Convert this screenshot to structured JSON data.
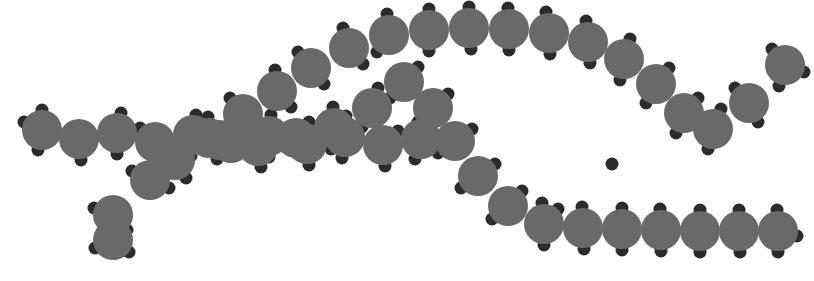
{
  "canvas": {
    "width": 814,
    "height": 281,
    "background_color": "#ffffff",
    "title": "space-filling-molecular-model"
  },
  "style": {
    "carbon_color": "#6b6b6b",
    "hydrogen_color": "#2b2b2b",
    "carbon_radius": 20,
    "hydrogen_radius": 6.5,
    "outline_color": "#5f5f5f",
    "noise_opacity": 0.07
  },
  "legend": {
    "carbon_label": "carbon (large grey sphere)",
    "hydrogen_label": "hydrogen (small dark sphere)"
  },
  "chains": [
    {
      "name": "lower-left-main-chain",
      "description": "zig-zag alkyl chain entering from the left edge and rising to the right",
      "carbons": [
        {
          "x": 42,
          "y": 130,
          "hydrogens": [
            [
              -18,
              -8
            ],
            [
              0,
              -20
            ],
            [
              -4,
              20
            ]
          ]
        },
        {
          "x": 79,
          "y": 139,
          "hydrogens": [
            [
              2,
              21
            ]
          ]
        },
        {
          "x": 117,
          "y": 133,
          "hydrogens": [
            [
              4,
              -20
            ],
            [
              0,
              21
            ]
          ]
        },
        {
          "x": 155,
          "y": 142,
          "hydrogens": [
            [
              -15,
              -14
            ],
            [
              2,
              21
            ]
          ]
        },
        {
          "x": 193,
          "y": 135,
          "hydrogens": [
            [
              3,
              -20
            ],
            [
              -2,
              21
            ]
          ]
        },
        {
          "x": 231,
          "y": 143,
          "hydrogens": [
            [
              15,
              -14
            ],
            [
              -14,
              16
            ]
          ]
        },
        {
          "x": 269,
          "y": 136,
          "hydrogens": [
            [
              2,
              -21
            ],
            [
              0,
              21
            ]
          ]
        },
        {
          "x": 307,
          "y": 144,
          "hydrogens": [
            [
              14,
              -15
            ],
            [
              2,
              21
            ]
          ]
        },
        {
          "x": 345,
          "y": 137,
          "hydrogens": [
            [
              1,
              -21
            ],
            [
              -3,
              21
            ]
          ]
        },
        {
          "x": 383,
          "y": 145,
          "hydrogens": [
            [
              15,
              -14
            ],
            [
              2,
              21
            ]
          ]
        },
        {
          "x": 421,
          "y": 139,
          "hydrogens": [
            [
              5,
              -20
            ],
            [
              -6,
              20
            ]
          ]
        }
      ]
    },
    {
      "name": "lower-left-branch",
      "description": "short methyl branch descending from the main chain",
      "carbons": [
        {
          "x": 150,
          "y": 180,
          "hydrogens": [
            [
              -18,
              -9
            ],
            [
              19,
              8
            ]
          ]
        },
        {
          "x": 113,
          "y": 215,
          "hydrogens": [
            [
              -19,
              -7
            ],
            [
              -11,
              18
            ],
            [
              14,
              15
            ]
          ]
        },
        {
          "x": 113,
          "y": 240,
          "hydrogens": [
            [
              -18,
              8
            ],
            [
              16,
              12
            ]
          ]
        }
      ]
    },
    {
      "name": "upper-chain",
      "description": "chain rising from lower-left, cresting across the top, dipping and rising to the right edge",
      "carbons": [
        {
          "x": 175,
          "y": 160,
          "hydrogens": [
            [
              -20,
              2
            ],
            [
              11,
              18
            ]
          ]
        },
        {
          "x": 209,
          "y": 138,
          "hydrogens": [
            [
              -1,
              -21
            ],
            [
              14,
              16
            ]
          ]
        },
        {
          "x": 243,
          "y": 114,
          "hydrogens": [
            [
              -13,
              -16
            ],
            [
              15,
              14
            ]
          ]
        },
        {
          "x": 277,
          "y": 91,
          "hydrogens": [
            [
              -2,
              -21
            ],
            [
              14,
              16
            ]
          ]
        },
        {
          "x": 311,
          "y": 68,
          "hydrogens": [
            [
              -13,
              -16
            ],
            [
              13,
              16
            ]
          ]
        },
        {
          "x": 349,
          "y": 48,
          "hydrogens": [
            [
              -6,
              -20
            ],
            [
              14,
              16
            ]
          ]
        },
        {
          "x": 389,
          "y": 35,
          "hydrogens": [
            [
              -2,
              -21
            ],
            [
              -12,
              17
            ]
          ]
        },
        {
          "x": 429,
          "y": 30,
          "hydrogens": [
            [
              0,
              -21
            ],
            [
              0,
              21
            ]
          ]
        },
        {
          "x": 469,
          "y": 28,
          "hydrogens": [
            [
              0,
              -21
            ],
            [
              2,
              21
            ]
          ]
        },
        {
          "x": 509,
          "y": 29,
          "hydrogens": [
            [
              -1,
              -21
            ],
            [
              0,
              21
            ]
          ]
        },
        {
          "x": 549,
          "y": 33,
          "hydrogens": [
            [
              -3,
              -21
            ],
            [
              1,
              21
            ]
          ]
        },
        {
          "x": 588,
          "y": 42,
          "hydrogens": [
            [
              -2,
              -21
            ],
            [
              2,
              21
            ]
          ]
        },
        {
          "x": 624,
          "y": 59,
          "hydrogens": [
            [
              6,
              -20
            ],
            [
              -4,
              21
            ]
          ]
        },
        {
          "x": 656,
          "y": 84,
          "hydrogens": [
            [
              13,
              -16
            ],
            [
              -10,
              19
            ]
          ]
        },
        {
          "x": 684,
          "y": 113,
          "hydrogens": [
            [
              14,
              -15
            ],
            [
              -8,
              20
            ]
          ]
        },
        {
          "x": 713,
          "y": 129,
          "hydrogens": [
            [
              -5,
              20
            ],
            [
              8,
              -20
            ]
          ]
        },
        {
          "x": 749,
          "y": 103,
          "hydrogens": [
            [
              -14,
              -15
            ],
            [
              9,
              19
            ]
          ]
        },
        {
          "x": 785,
          "y": 65,
          "hydrogens": [
            [
              -13,
              -16
            ],
            [
              19,
              7
            ],
            [
              -6,
              21
            ]
          ]
        }
      ]
    },
    {
      "name": "lower-right-chain",
      "description": "second chain branching down-right from the crossing point then running horizontally to the right edge",
      "carbons": [
        {
          "x": 220,
          "y": 140,
          "hydrogens": [
            [
              -18,
              -10
            ]
          ]
        },
        {
          "x": 258,
          "y": 146,
          "hydrogens": [
            [
              3,
              21
            ]
          ]
        },
        {
          "x": 296,
          "y": 138,
          "hydrogens": [
            [
              13,
              -16
            ]
          ]
        },
        {
          "x": 334,
          "y": 128,
          "hydrogens": [
            [
              -1,
              -21
            ],
            [
              -3,
              21
            ]
          ]
        },
        {
          "x": 372,
          "y": 108,
          "hydrogens": [
            [
              6,
              -20
            ],
            [
              -10,
              19
            ]
          ]
        },
        {
          "x": 404,
          "y": 82,
          "hydrogens": [
            [
              14,
              -15
            ],
            [
              -14,
              16
            ]
          ]
        },
        {
          "x": 433,
          "y": 108,
          "hydrogens": [
            [
              15,
              -14
            ],
            [
              -15,
              14
            ]
          ]
        },
        {
          "x": 455,
          "y": 141,
          "hydrogens": [
            [
              17,
              -12
            ],
            [
              -17,
              12
            ]
          ]
        },
        {
          "x": 478,
          "y": 176,
          "hydrogens": [
            [
              17,
              -12
            ],
            [
              -17,
              12
            ]
          ]
        },
        {
          "x": 508,
          "y": 206,
          "hydrogens": [
            [
              14,
              -15
            ],
            [
              -16,
              13
            ]
          ]
        },
        {
          "x": 544,
          "y": 224,
          "hydrogens": [
            [
              -2,
              -21
            ],
            [
              0,
              21
            ]
          ]
        },
        {
          "x": 583,
          "y": 228,
          "hydrogens": [
            [
              -1,
              -21
            ],
            [
              1,
              21
            ]
          ]
        },
        {
          "x": 622,
          "y": 229,
          "hydrogens": [
            [
              0,
              -21
            ],
            [
              0,
              21
            ]
          ]
        },
        {
          "x": 661,
          "y": 230,
          "hydrogens": [
            [
              -1,
              -21
            ],
            [
              0,
              21
            ]
          ]
        },
        {
          "x": 700,
          "y": 231,
          "hydrogens": [
            [
              0,
              -21
            ],
            [
              0,
              21
            ]
          ]
        },
        {
          "x": 739,
          "y": 231,
          "hydrogens": [
            [
              0,
              -21
            ],
            [
              1,
              21
            ]
          ]
        },
        {
          "x": 778,
          "y": 231,
          "hydrogens": [
            [
              -1,
              -21
            ],
            [
              19,
              5
            ],
            [
              0,
              21
            ]
          ]
        }
      ]
    }
  ],
  "stray_hydrogens": [
    {
      "x": 612,
      "y": 164
    },
    {
      "x": 558,
      "y": 209
    },
    {
      "x": 154,
      "y": 180
    }
  ]
}
